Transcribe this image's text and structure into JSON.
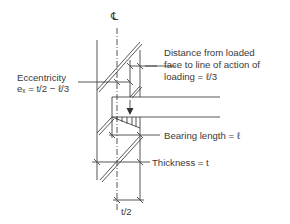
{
  "diagram": {
    "centerline_symbol": "℄",
    "labels": {
      "eccentricity_line1": "Eccentricity",
      "eccentricity_line2": "eₓ = t/2 − ℓ/3",
      "distance_line1": "Distance from loaded",
      "distance_line2": "face to line of action of",
      "distance_line3": "loading = ℓ/3",
      "bearing_length": "Bearing length =  ℓ",
      "thickness": "Thickness = t",
      "half_thickness": "t/2"
    },
    "colors": {
      "line": "#444444",
      "text": "#3a3a3a",
      "background": "#ffffff"
    }
  }
}
